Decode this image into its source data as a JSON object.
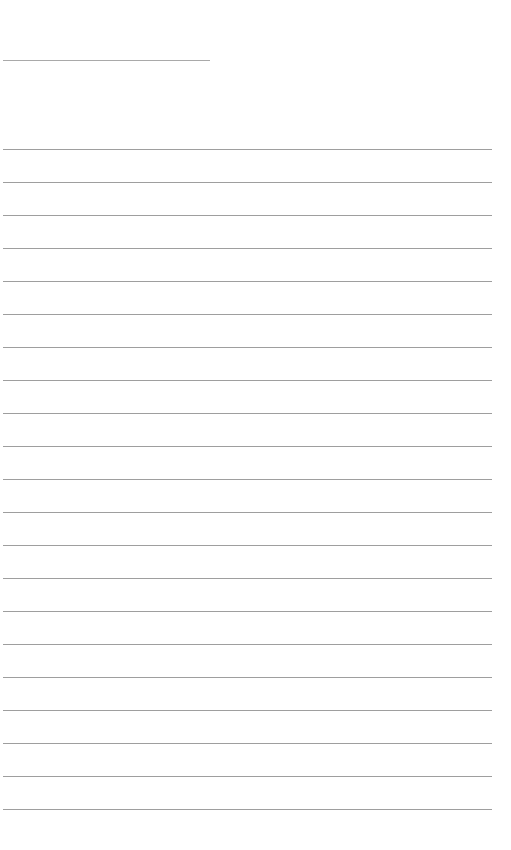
{
  "page": {
    "type": "blank-lined-sheet",
    "background": "#ffffff",
    "line_color": "#9e9e9e",
    "title_line": {
      "x": 3,
      "y": 60,
      "width": 207
    },
    "rules": {
      "count": 21,
      "first_y": 149,
      "spacing": 33,
      "x": 3,
      "width": 489
    }
  }
}
